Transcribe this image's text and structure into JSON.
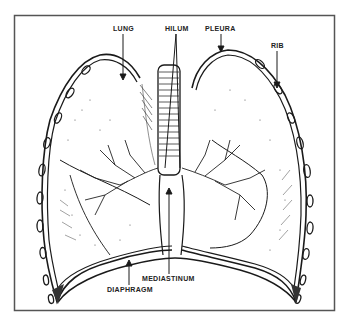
{
  "figure": {
    "frame_color": "#555555",
    "ink_color": "#1a1a1a",
    "labels": [
      {
        "id": "lung",
        "text": "LUNG",
        "x": 113,
        "y": 31
      },
      {
        "id": "hilum",
        "text": "HILUM",
        "x": 165,
        "y": 31
      },
      {
        "id": "pleura",
        "text": "PLEURA",
        "x": 205,
        "y": 31
      },
      {
        "id": "rib",
        "text": "RIB",
        "x": 271,
        "y": 48
      },
      {
        "id": "mediastinum",
        "text": "MEDIASTINUM",
        "x": 142,
        "y": 281
      },
      {
        "id": "diaphragm",
        "text": "DIAPHRAGM",
        "x": 107,
        "y": 292
      }
    ]
  }
}
